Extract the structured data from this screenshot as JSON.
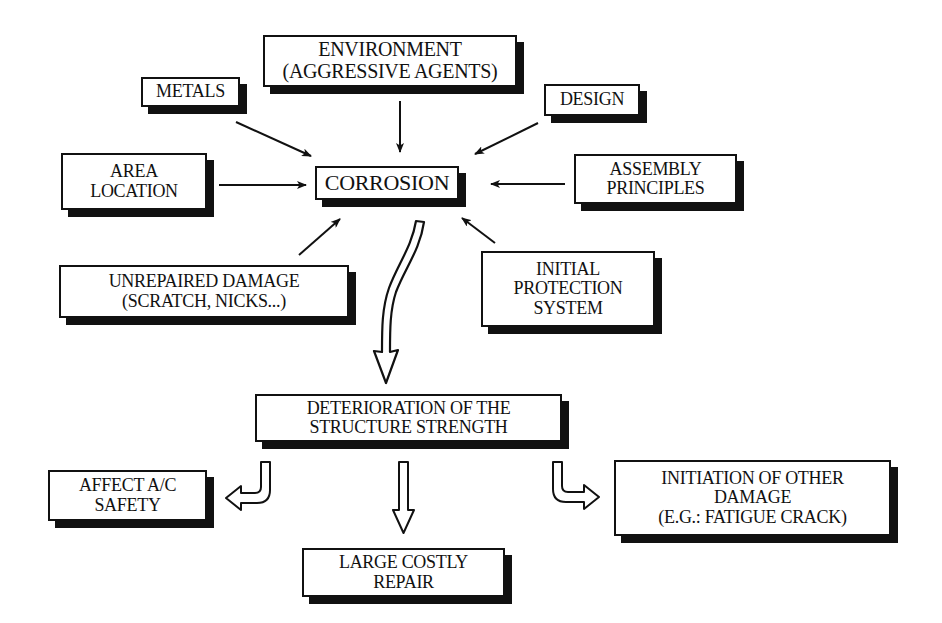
{
  "diagram": {
    "type": "cause-effect flow diagram",
    "central_node": {
      "id": "corrosion",
      "lines": [
        "CORROSION"
      ]
    },
    "causes": [
      {
        "id": "environment",
        "lines": [
          "ENVIRONMENT",
          "(AGGRESSIVE AGENTS)"
        ]
      },
      {
        "id": "metals",
        "lines": [
          "METALS"
        ]
      },
      {
        "id": "design",
        "lines": [
          "DESIGN"
        ]
      },
      {
        "id": "area-location",
        "lines": [
          "AREA",
          "LOCATION"
        ]
      },
      {
        "id": "assembly-principles",
        "lines": [
          "ASSEMBLY",
          "PRINCIPLES"
        ]
      },
      {
        "id": "unrepaired-damage",
        "lines": [
          "UNREPAIRED DAMAGE",
          "(SCRATCH, NICKS...)"
        ]
      },
      {
        "id": "initial-protection",
        "lines": [
          "INITIAL",
          "PROTECTION",
          "SYSTEM"
        ]
      }
    ],
    "result_node": {
      "id": "deterioration",
      "lines": [
        "DETERIORATION OF THE",
        "STRUCTURE STRENGTH"
      ]
    },
    "consequences": [
      {
        "id": "affect-safety",
        "lines": [
          "AFFECT A/C",
          "SAFETY"
        ]
      },
      {
        "id": "costly-repair",
        "lines": [
          "LARGE COSTLY",
          "REPAIR"
        ]
      },
      {
        "id": "other-damage",
        "lines": [
          "INITIATION OF OTHER",
          "DAMAGE",
          "(E.G.: FATIGUE CRACK)"
        ]
      }
    ],
    "edges": [
      {
        "from": "environment",
        "to": "corrosion",
        "style": "thin-arrow"
      },
      {
        "from": "metals",
        "to": "corrosion",
        "style": "thin-arrow"
      },
      {
        "from": "design",
        "to": "corrosion",
        "style": "thin-arrow"
      },
      {
        "from": "area-location",
        "to": "corrosion",
        "style": "thin-arrow"
      },
      {
        "from": "assembly-principles",
        "to": "corrosion",
        "style": "thin-arrow"
      },
      {
        "from": "unrepaired-damage",
        "to": "corrosion",
        "style": "thin-arrow"
      },
      {
        "from": "initial-protection",
        "to": "corrosion",
        "style": "thin-arrow"
      },
      {
        "from": "corrosion",
        "to": "deterioration",
        "style": "hollow-curved-arrow"
      },
      {
        "from": "deterioration",
        "to": "affect-safety",
        "style": "hollow-bent-arrow"
      },
      {
        "from": "deterioration",
        "to": "costly-repair",
        "style": "hollow-arrow"
      },
      {
        "from": "deterioration",
        "to": "other-damage",
        "style": "hollow-bent-arrow"
      }
    ],
    "colors": {
      "ink": "#111111",
      "background": "#ffffff"
    }
  }
}
